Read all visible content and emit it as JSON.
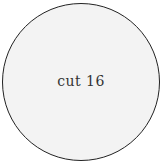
{
  "node": {
    "label": "cut 16",
    "shape": "circle",
    "fill_color": "#f3f3f3",
    "border_color": "#222222",
    "text_color": "#333333"
  }
}
